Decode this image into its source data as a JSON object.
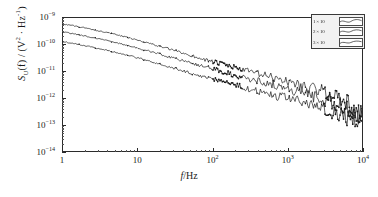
{
  "figure": {
    "background_color": "#ffffff",
    "line_color": "#1a1a1a",
    "frame_color": "#2b2b2b"
  },
  "axes": {
    "y_label": "S",
    "y_label_sub": "U",
    "y_label_mid": "(f) / (V",
    "y_label_sup": "2",
    "y_label_mid2": " · Hz",
    "y_label_sup2": "-1",
    "y_label_end": ")",
    "x_label_italic": "f",
    "x_label_rest": "/Hz",
    "y_ticks": [
      {
        "exp": "-9",
        "base": "10"
      },
      {
        "exp": "-10",
        "base": "10"
      },
      {
        "exp": "-11",
        "base": "10"
      },
      {
        "exp": "-12",
        "base": "10"
      },
      {
        "exp": "-13",
        "base": "10"
      },
      {
        "exp": "-14",
        "base": "10"
      }
    ],
    "x_ticks": [
      {
        "base": "1",
        "exp": ""
      },
      {
        "base": "10",
        "exp": ""
      },
      {
        "base": "10",
        "exp": "2"
      },
      {
        "base": "10",
        "exp": "3"
      },
      {
        "base": "10",
        "exp": "4"
      }
    ]
  },
  "legend": {
    "rows": [
      {
        "text": "1 × 10",
        "sample": "wavy-line-1"
      },
      {
        "text": "2 × 10",
        "sample": "wavy-line-2"
      },
      {
        "text": "3 × 10",
        "sample": "wavy-line-3"
      }
    ]
  },
  "chart_data": {
    "type": "line",
    "title": "",
    "xlabel": "f/Hz",
    "ylabel": "S_U(f) / (V^2 · Hz^-1)",
    "xscale": "log",
    "yscale": "log",
    "xlim": [
      1,
      10000
    ],
    "ylim": [
      1e-14,
      1e-09
    ],
    "grid": false,
    "legend_position": "top-right-inset",
    "markers": "dots-on-line",
    "series": [
      {
        "name": "curve-upper",
        "x": [
          1,
          2,
          4,
          7,
          10,
          20,
          40,
          70,
          100,
          150,
          200,
          300,
          500,
          700,
          1000,
          1500,
          2000,
          3000,
          4000,
          5000,
          6000,
          7000,
          8000
        ],
        "y": [
          6e-10,
          4.2e-10,
          2.8e-10,
          1.9e-10,
          1.5e-10,
          8.5e-11,
          4.8e-11,
          3e-11,
          2.3e-11,
          1.7e-11,
          1.4e-11,
          1e-11,
          7e-12,
          5.4e-12,
          4.2e-12,
          3e-12,
          2.4e-12,
          1.7e-12,
          1.3e-12,
          1e-12,
          7.5e-13,
          5e-13,
          2.6e-13
        ]
      },
      {
        "name": "curve-middle",
        "x": [
          1,
          2,
          4,
          7,
          10,
          20,
          40,
          70,
          100,
          150,
          200,
          300,
          500,
          700,
          1000,
          1500,
          2000,
          3000,
          4000,
          5000,
          6000,
          7000,
          8000
        ],
        "y": [
          3e-10,
          2.1e-10,
          1.4e-10,
          9.5e-11,
          7.5e-11,
          4.3e-11,
          2.5e-11,
          1.6e-11,
          1.25e-11,
          9e-12,
          7.3e-12,
          5.3e-12,
          3.7e-12,
          2.9e-12,
          2.2e-12,
          1.6e-12,
          1.3e-12,
          9e-13,
          7e-13,
          5.3e-13,
          4e-13,
          2.9e-13,
          2e-13
        ]
      },
      {
        "name": "curve-lower",
        "x": [
          1,
          2,
          4,
          7,
          10,
          20,
          40,
          70,
          100,
          150,
          200,
          300,
          500,
          700,
          1000,
          1500,
          2000,
          3000,
          4000,
          5000,
          6000,
          7000,
          8000
        ],
        "y": [
          1.3e-10,
          9e-11,
          6e-11,
          4.1e-11,
          3.2e-11,
          1.8e-11,
          1.05e-11,
          6.6e-12,
          5e-12,
          3.7e-12,
          3e-12,
          2.2e-12,
          1.55e-12,
          1.2e-12,
          9.5e-13,
          7e-13,
          5.7e-13,
          4e-13,
          3.1e-13,
          2.4e-13,
          1.9e-13,
          1.5e-13,
          1.25e-13
        ]
      }
    ]
  }
}
